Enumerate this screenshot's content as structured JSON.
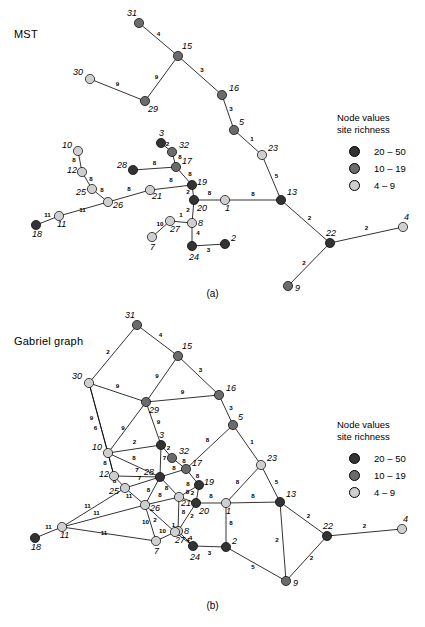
{
  "figure": {
    "panels": [
      {
        "id": "a",
        "title": "MST",
        "caption": "(a)",
        "legend": {
          "head_line1": "Node values",
          "head_line2": "site richness",
          "classes": [
            {
              "label": "20 – 50",
              "swatch": "n-high",
              "color": "#333333"
            },
            {
              "label": "10 – 19",
              "swatch": "n-mid",
              "color": "#6b6b6b"
            },
            {
              "label": "4 – 9",
              "swatch": "n-low",
              "color": "#cfcfcf"
            }
          ]
        }
      },
      {
        "id": "b",
        "title": "Gabriel graph",
        "caption": "(b)",
        "legend": {
          "head_line1": "Node values",
          "head_line2": "site richness",
          "classes": [
            {
              "label": "20 – 50",
              "swatch": "n-high",
              "color": "#333333"
            },
            {
              "label": "10 – 19",
              "swatch": "n-mid",
              "color": "#6b6b6b"
            },
            {
              "label": "4 – 9",
              "swatch": "n-low",
              "color": "#cfcfcf"
            }
          ]
        }
      }
    ]
  },
  "chart_data": {
    "type": "diagram",
    "subtype": "node-link-network",
    "node_value_legend": {
      "title_line1": "Node values",
      "title_line2": "site richness",
      "classes": [
        {
          "range": "20 – 50",
          "class": "high",
          "color": "#333333"
        },
        {
          "range": "10 – 19",
          "class": "mid",
          "color": "#6b6b6b"
        },
        {
          "range": "4 – 9",
          "class": "low",
          "color": "#cfcfcf"
        }
      ]
    },
    "nodes": [
      {
        "id": "31",
        "label": "31",
        "class": "mid",
        "lx": -12,
        "ly": -7
      },
      {
        "id": "15",
        "label": "15",
        "class": "mid",
        "lx": 4,
        "ly": -7
      },
      {
        "id": "30",
        "label": "30",
        "class": "low",
        "lx": -17,
        "ly": -4
      },
      {
        "id": "29",
        "label": "29",
        "class": "mid",
        "lx": 3,
        "ly": 11
      },
      {
        "id": "16",
        "label": "16",
        "class": "mid",
        "lx": 7,
        "ly": -4
      },
      {
        "id": "5",
        "label": "5",
        "class": "mid",
        "lx": 5,
        "ly": -5
      },
      {
        "id": "23",
        "label": "23",
        "class": "low",
        "lx": 6,
        "ly": -4
      },
      {
        "id": "13",
        "label": "13",
        "class": "high",
        "lx": 6,
        "ly": -5
      },
      {
        "id": "22",
        "label": "22",
        "class": "high",
        "lx": -4,
        "ly": -7
      },
      {
        "id": "4",
        "label": "4",
        "class": "low",
        "lx": 1,
        "ly": -7
      },
      {
        "id": "9",
        "label": "9",
        "class": "mid",
        "lx": 7,
        "ly": 5
      },
      {
        "id": "10",
        "label": "10",
        "class": "low",
        "lx": -16,
        "ly": -3
      },
      {
        "id": "12",
        "label": "12",
        "class": "low",
        "lx": -15,
        "ly": 1
      },
      {
        "id": "25",
        "label": "25",
        "class": "low",
        "lx": -16,
        "ly": 6
      },
      {
        "id": "11",
        "label": "11",
        "class": "low",
        "lx": -2,
        "ly": 11
      },
      {
        "id": "18",
        "label": "18",
        "class": "high",
        "lx": -4,
        "ly": 12
      },
      {
        "id": "26",
        "label": "26",
        "class": "low",
        "lx": 5,
        "ly": 6
      },
      {
        "id": "3",
        "label": "3",
        "class": "high",
        "lx": -2,
        "ly": -7
      },
      {
        "id": "32",
        "label": "32",
        "class": "mid",
        "lx": 7,
        "ly": -4
      },
      {
        "id": "28",
        "label": "28",
        "class": "high",
        "lx": -16,
        "ly": -2
      },
      {
        "id": "17",
        "label": "17",
        "class": "mid",
        "lx": 6,
        "ly": -3
      },
      {
        "id": "19",
        "label": "19",
        "class": "high",
        "lx": 5,
        "ly": 0
      },
      {
        "id": "21",
        "label": "21",
        "class": "low",
        "lx": 2,
        "ly": 9
      },
      {
        "id": "20",
        "label": "20",
        "class": "high",
        "lx": 3,
        "ly": 11
      },
      {
        "id": "1",
        "label": "1",
        "class": "low",
        "lx": 0,
        "ly": 11
      },
      {
        "id": "8",
        "label": "8",
        "class": "low",
        "lx": 6,
        "ly": 3
      },
      {
        "id": "27",
        "label": "27",
        "class": "low",
        "lx": 0,
        "ly": 11
      },
      {
        "id": "7",
        "label": "7",
        "class": "low",
        "lx": -2,
        "ly": 13
      },
      {
        "id": "24",
        "label": "24",
        "class": "high",
        "lx": -3,
        "ly": 14
      },
      {
        "id": "2",
        "label": "2",
        "class": "high",
        "lx": 6,
        "ly": -3
      }
    ],
    "mst_edges": [
      {
        "s": "31",
        "t": "15",
        "w": "4"
      },
      {
        "s": "15",
        "t": "29",
        "w": "9"
      },
      {
        "s": "30",
        "t": "29",
        "w": "9"
      },
      {
        "s": "15",
        "t": "16",
        "w": "3"
      },
      {
        "s": "16",
        "t": "5",
        "w": "3"
      },
      {
        "s": "5",
        "t": "23",
        "w": "1"
      },
      {
        "s": "23",
        "t": "13",
        "w": "5"
      },
      {
        "s": "13",
        "t": "1",
        "w": "8"
      },
      {
        "s": "13",
        "t": "22",
        "w": "2"
      },
      {
        "s": "22",
        "t": "4",
        "w": "2"
      },
      {
        "s": "22",
        "t": "9",
        "w": "2"
      },
      {
        "s": "10",
        "t": "12",
        "w": "8"
      },
      {
        "s": "12",
        "t": "25",
        "w": "8"
      },
      {
        "s": "25",
        "t": "26",
        "w": "8"
      },
      {
        "s": "26",
        "t": "11",
        "w": "11"
      },
      {
        "s": "11",
        "t": "18",
        "w": "11"
      },
      {
        "s": "26",
        "t": "21",
        "w": "8"
      },
      {
        "s": "21",
        "t": "19",
        "w": "8"
      },
      {
        "s": "3",
        "t": "32",
        "w": "2"
      },
      {
        "s": "32",
        "t": "17",
        "w": "8"
      },
      {
        "s": "28",
        "t": "17",
        "w": "8"
      },
      {
        "s": "17",
        "t": "19",
        "w": "8"
      },
      {
        "s": "19",
        "t": "20",
        "w": "2"
      },
      {
        "s": "20",
        "t": "1",
        "w": "8"
      },
      {
        "s": "20",
        "t": "8",
        "w": "2"
      },
      {
        "s": "8",
        "t": "27",
        "w": "1"
      },
      {
        "s": "27",
        "t": "7",
        "w": "10"
      },
      {
        "s": "8",
        "t": "24",
        "w": "4"
      },
      {
        "s": "24",
        "t": "2",
        "w": "3"
      }
    ],
    "gabriel_edges": [
      {
        "s": "31",
        "t": "15",
        "w": "4"
      },
      {
        "s": "31",
        "t": "30",
        "w": "2"
      },
      {
        "s": "30",
        "t": "29",
        "w": "9"
      },
      {
        "s": "30",
        "t": "12",
        "w": "6"
      },
      {
        "s": "30",
        "t": "10",
        "w": "9"
      },
      {
        "s": "15",
        "t": "29",
        "w": "9"
      },
      {
        "s": "15",
        "t": "16",
        "w": "3"
      },
      {
        "s": "29",
        "t": "16",
        "w": "9"
      },
      {
        "s": "29",
        "t": "3",
        "w": "9"
      },
      {
        "s": "29",
        "t": "10",
        "w": "9"
      },
      {
        "s": "16",
        "t": "5",
        "w": "3"
      },
      {
        "s": "5",
        "t": "23",
        "w": "1"
      },
      {
        "s": "5",
        "t": "17",
        "w": "8"
      },
      {
        "s": "23",
        "t": "13",
        "w": "5"
      },
      {
        "s": "23",
        "t": "1",
        "w": "8"
      },
      {
        "s": "13",
        "t": "1",
        "w": "8"
      },
      {
        "s": "13",
        "t": "22",
        "w": "2"
      },
      {
        "s": "13",
        "t": "9",
        "w": "2"
      },
      {
        "s": "22",
        "t": "4",
        "w": "2"
      },
      {
        "s": "22",
        "t": "9",
        "w": "2"
      },
      {
        "s": "10",
        "t": "3",
        "w": "2"
      },
      {
        "s": "10",
        "t": "12",
        "w": "8"
      },
      {
        "s": "10",
        "t": "28",
        "w": "8"
      },
      {
        "s": "12",
        "t": "25",
        "w": "8"
      },
      {
        "s": "12",
        "t": "28",
        "w": "7"
      },
      {
        "s": "25",
        "t": "26",
        "w": "11"
      },
      {
        "s": "25",
        "t": "11",
        "w": "11"
      },
      {
        "s": "25",
        "t": "28",
        "w": "7"
      },
      {
        "s": "26",
        "t": "11",
        "w": "11"
      },
      {
        "s": "26",
        "t": "28",
        "w": "8"
      },
      {
        "s": "26",
        "t": "21",
        "w": "8"
      },
      {
        "s": "26",
        "t": "7",
        "w": "10"
      },
      {
        "s": "26",
        "t": "27",
        "w": "2"
      },
      {
        "s": "11",
        "t": "18",
        "w": "11"
      },
      {
        "s": "11",
        "t": "7",
        "w": "11"
      },
      {
        "s": "3",
        "t": "32",
        "w": "2"
      },
      {
        "s": "3",
        "t": "28",
        "w": "7"
      },
      {
        "s": "32",
        "t": "17",
        "w": "8"
      },
      {
        "s": "28",
        "t": "17",
        "w": "8"
      },
      {
        "s": "28",
        "t": "21",
        "w": "8"
      },
      {
        "s": "17",
        "t": "19",
        "w": "8"
      },
      {
        "s": "19",
        "t": "21",
        "w": "8"
      },
      {
        "s": "19",
        "t": "20",
        "w": "2"
      },
      {
        "s": "21",
        "t": "20",
        "w": "8"
      },
      {
        "s": "21",
        "t": "8",
        "w": "8"
      },
      {
        "s": "20",
        "t": "1",
        "w": "8"
      },
      {
        "s": "20",
        "t": "8",
        "w": "2"
      },
      {
        "s": "1",
        "t": "2",
        "w": "8"
      },
      {
        "s": "8",
        "t": "27",
        "w": "1"
      },
      {
        "s": "8",
        "t": "24",
        "w": "4"
      },
      {
        "s": "27",
        "t": "7",
        "w": "10"
      },
      {
        "s": "27",
        "t": "24",
        "w": "4"
      },
      {
        "s": "24",
        "t": "2",
        "w": "3"
      },
      {
        "s": "2",
        "t": "9",
        "w": "5"
      }
    ]
  }
}
